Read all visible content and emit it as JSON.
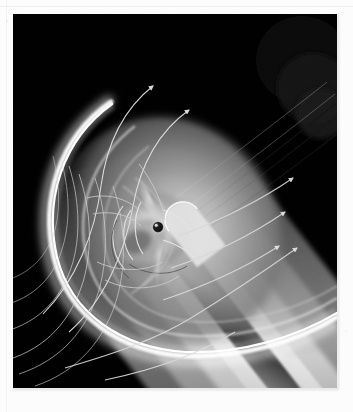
{
  "image": {
    "title": "Planetary magnetosphere simulation",
    "subject": "magnetosphere",
    "medium": "grayscale photographic print",
    "palette": {
      "mount": "#fcfcfc",
      "background": "#000000",
      "bow_shock": "#ffffff",
      "magnetosheath": "#b9b9b9",
      "tail_lobe_bright": "#d8d8d8",
      "tail_lobe_mid": "#9a9a9a",
      "tail_lobe_dark": "#565656",
      "tail_lobe_darkest": "#2a2a2a",
      "streamline": "#dcdcdc",
      "planet": "#141414",
      "planet_highlight": "#f2f2f2"
    },
    "plate": {
      "x": 13,
      "y": 14,
      "width": 324,
      "height": 374
    }
  },
  "scene": {
    "planet": {
      "cx": 145,
      "cy": 213,
      "r": 5.2,
      "label": "planet"
    },
    "flow_direction": "solar wind from lower-left toward upper-right",
    "tail_axis_angle_deg": -32,
    "features": [
      {
        "name": "bow-shock",
        "description": "bright white parabolic arc upstream of the planet"
      },
      {
        "name": "magnetopause",
        "description": "inner boundary shell enclosing the magnetosphere"
      },
      {
        "name": "magnetosheath",
        "description": "gray shocked-plasma region between bow shock and magnetopause"
      },
      {
        "name": "magnetotail",
        "description": "layered cylindrical lobes extending to upper right"
      },
      {
        "name": "polar-cusp",
        "description": "funnel-shaped bright features above and below the planet"
      },
      {
        "name": "plasma-sheet",
        "description": "dark central band inside the tail"
      }
    ],
    "streamlines": {
      "count": 12,
      "arrowheads": 6,
      "description": "solar wind flow lines deflected around the bow shock"
    }
  },
  "annotations": {
    "none_visible": "no text, labels, axes or legends appear in the photograph"
  }
}
